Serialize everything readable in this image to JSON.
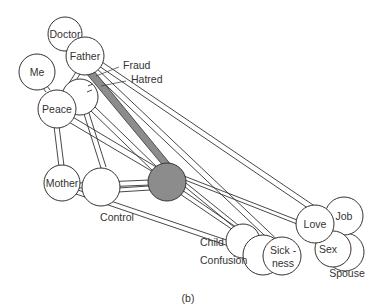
{
  "caption": "(b)",
  "nodes": {
    "doctor": "Doctor",
    "father": "Father",
    "me": "Me",
    "peace": "Peace",
    "mother": "Mother",
    "control": "Control",
    "child": "Child",
    "confusion": "Confusion",
    "sickness_1": "Sick -",
    "sickness_2": "ness",
    "love": "Love",
    "job": "Job",
    "sex": "Sex",
    "spouse": "Spouse",
    "fraud": "Fraud",
    "hatred": "Hatred"
  },
  "colors": {
    "line": "#333333",
    "center_fill": "#8c8c8c",
    "band_fill": "#8c8c8c",
    "background": "#ffffff"
  }
}
